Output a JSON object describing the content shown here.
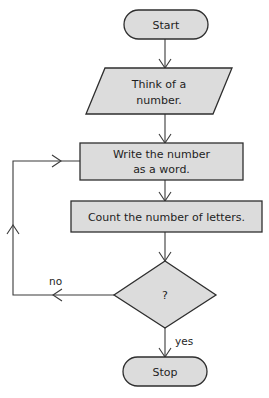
{
  "colors": {
    "node_fill": "#dcdcdc",
    "node_stroke": "#2e2e2e",
    "edge": "#3a3a3a",
    "text": "#1e1e1e",
    "background": "#ffffff"
  },
  "nodes": {
    "start": {
      "type": "terminator",
      "label": "Start"
    },
    "input": {
      "type": "io",
      "label_line1": "Think of a",
      "label_line2": "number."
    },
    "write": {
      "type": "process",
      "label_line1": "Write the number",
      "label_line2": "as a word."
    },
    "count": {
      "type": "process",
      "label": "Count the number of letters."
    },
    "decision": {
      "type": "decision",
      "label": "?"
    },
    "stop": {
      "type": "terminator",
      "label": "Stop"
    }
  },
  "edges": [
    {
      "from": "start",
      "to": "input",
      "label": ""
    },
    {
      "from": "input",
      "to": "write",
      "label": ""
    },
    {
      "from": "write",
      "to": "count",
      "label": ""
    },
    {
      "from": "count",
      "to": "decision",
      "label": ""
    },
    {
      "from": "decision",
      "to": "stop",
      "label": "yes"
    },
    {
      "from": "decision",
      "to": "write",
      "label": "no"
    }
  ],
  "edge_labels": {
    "yes": "yes",
    "no": "no"
  }
}
